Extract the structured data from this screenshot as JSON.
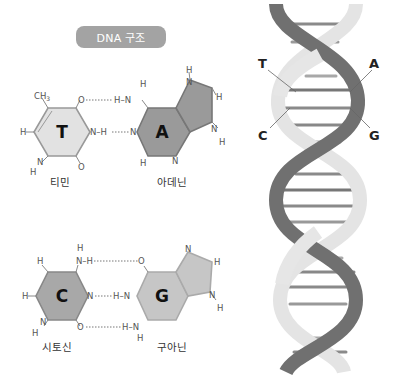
{
  "title": "DNA 구조",
  "pairs": [
    {
      "left": {
        "letter": "T",
        "name": "티민",
        "substituent": "CH3",
        "ch3_sub": "3"
      },
      "right": {
        "letter": "A",
        "name": "아데닌"
      }
    },
    {
      "left": {
        "letter": "C",
        "name": "시토신"
      },
      "right": {
        "letter": "G",
        "name": "구아닌"
      }
    }
  ],
  "atoms": {
    "H": "H",
    "N": "N",
    "O": "O",
    "C": "C"
  },
  "helix_labels": {
    "top_left": "T",
    "top_right": "A",
    "bottom_left": "C",
    "bottom_right": "G"
  },
  "colors": {
    "pill": "#a3a3a3",
    "thymine_fill": "#e2e2e2",
    "adenine_fill": "#9a9a9a",
    "cytosine_fill": "#a8a8a8",
    "guanine_fill": "#c6c6c6",
    "strand_dark": "#6f6f6f",
    "strand_light": "#e6e6e6"
  }
}
